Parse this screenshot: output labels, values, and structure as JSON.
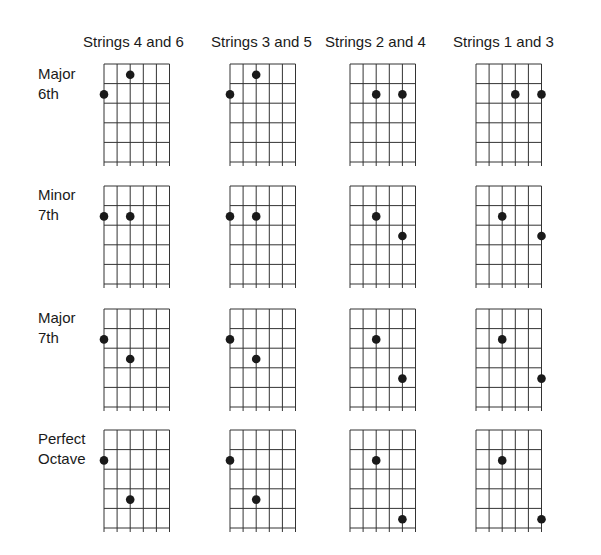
{
  "columns": [
    {
      "label": "Strings 4 and 6"
    },
    {
      "label": "Strings 3 and 5"
    },
    {
      "label": "Strings 2 and 4"
    },
    {
      "label": "Strings 1 and 3"
    }
  ],
  "rows": [
    {
      "label_line1": "Major",
      "label_line2": "6th"
    },
    {
      "label_line1": "Minor",
      "label_line2": "7th"
    },
    {
      "label_line1": "Major",
      "label_line2": "7th"
    },
    {
      "label_line1": "Perfect",
      "label_line2": "Octave"
    }
  ],
  "diagram": {
    "strings": 6,
    "frets": 5,
    "line_color": "#333333",
    "dot_color": "#1a1a1a"
  },
  "dots": [
    [
      [
        {
          "string": 1,
          "fret": 2
        },
        {
          "string": 3,
          "fret": 1
        }
      ],
      [
        {
          "string": 1,
          "fret": 2
        },
        {
          "string": 3,
          "fret": 1
        }
      ],
      [
        {
          "string": 3,
          "fret": 2
        },
        {
          "string": 5,
          "fret": 2
        }
      ],
      [
        {
          "string": 4,
          "fret": 2
        },
        {
          "string": 6,
          "fret": 2
        }
      ]
    ],
    [
      [
        {
          "string": 1,
          "fret": 2
        },
        {
          "string": 3,
          "fret": 2
        }
      ],
      [
        {
          "string": 1,
          "fret": 2
        },
        {
          "string": 3,
          "fret": 2
        }
      ],
      [
        {
          "string": 3,
          "fret": 2
        },
        {
          "string": 5,
          "fret": 3
        }
      ],
      [
        {
          "string": 3,
          "fret": 2
        },
        {
          "string": 6,
          "fret": 3
        }
      ]
    ],
    [
      [
        {
          "string": 1,
          "fret": 2
        },
        {
          "string": 3,
          "fret": 3
        }
      ],
      [
        {
          "string": 1,
          "fret": 2
        },
        {
          "string": 3,
          "fret": 3
        }
      ],
      [
        {
          "string": 3,
          "fret": 2
        },
        {
          "string": 5,
          "fret": 4
        }
      ],
      [
        {
          "string": 3,
          "fret": 2
        },
        {
          "string": 6,
          "fret": 4
        }
      ]
    ],
    [
      [
        {
          "string": 1,
          "fret": 2
        },
        {
          "string": 3,
          "fret": 4
        }
      ],
      [
        {
          "string": 1,
          "fret": 2
        },
        {
          "string": 3,
          "fret": 4
        }
      ],
      [
        {
          "string": 3,
          "fret": 2
        },
        {
          "string": 5,
          "fret": 5
        }
      ],
      [
        {
          "string": 3,
          "fret": 2
        },
        {
          "string": 6,
          "fret": 5
        }
      ]
    ]
  ]
}
